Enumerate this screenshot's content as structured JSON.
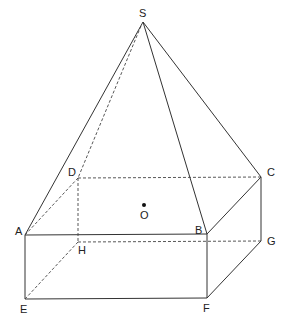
{
  "diagram": {
    "type": "geometry",
    "points": {
      "S": {
        "label": "S",
        "x": 143,
        "y": 22
      },
      "A": {
        "label": "A",
        "x": 25,
        "y": 235
      },
      "B": {
        "label": "B",
        "x": 207,
        "y": 234
      },
      "C": {
        "label": "C",
        "x": 261,
        "y": 177
      },
      "D": {
        "label": "D",
        "x": 78,
        "y": 178
      },
      "E": {
        "label": "E",
        "x": 25,
        "y": 299
      },
      "F": {
        "label": "F",
        "x": 207,
        "y": 298
      },
      "G": {
        "label": "G",
        "x": 261,
        "y": 241
      },
      "H": {
        "label": "H",
        "x": 78,
        "y": 242
      },
      "O": {
        "label": "O",
        "x": 144,
        "y": 205
      }
    },
    "solid_edges": [
      "SA",
      "SB",
      "SC",
      "AB",
      "BC",
      "AE",
      "BF",
      "CG",
      "EF",
      "FG"
    ],
    "dashed_edges": [
      "SD",
      "AD",
      "DC",
      "DH",
      "HE",
      "HG",
      "AC_none"
    ]
  }
}
